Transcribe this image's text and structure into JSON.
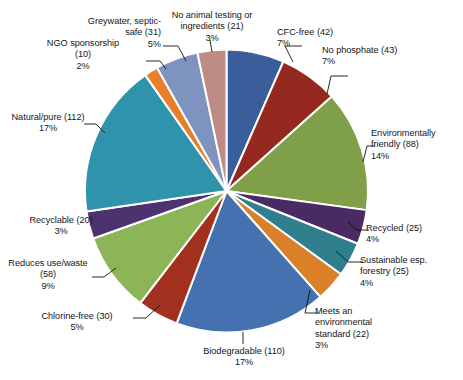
{
  "chart_data": {
    "type": "pie",
    "title": "",
    "subtitle": "",
    "xlabel": "",
    "ylabel": "",
    "legend_position": "none",
    "grid": false,
    "labels_show_counts": true,
    "labels_show_percent": true,
    "total": 637,
    "start_angle_deg": 0,
    "direction": "clockwise",
    "categories": [
      "CFC-free",
      "No phosphate",
      "Environmentally friendly",
      "Recycled",
      "Sustainable esp. forestry",
      "Meets an environmental standard",
      "Biodegradable",
      "Chlorine-free",
      "Reduces use/waste",
      "Recyclable",
      "Natural/pure",
      "NGO sponsorship",
      "Greywater, septic-safe",
      "No animal testing or ingredients"
    ],
    "values": [
      42,
      43,
      88,
      25,
      25,
      22,
      110,
      30,
      58,
      20,
      112,
      10,
      31,
      21
    ],
    "percents": [
      7,
      7,
      14,
      4,
      4,
      3,
      17,
      5,
      9,
      3,
      17,
      2,
      5,
      3
    ],
    "colors": [
      "#3a5e9b",
      "#96291f",
      "#7f9f49",
      "#4a2a63",
      "#2f7f8e",
      "#d98028",
      "#4671b0",
      "#a2301f",
      "#8bb557",
      "#4d3270",
      "#2f94ab",
      "#e8802b",
      "#7e93bd",
      "#bf8b85"
    ],
    "slices": [
      {
        "label": "CFC-free",
        "value": 42,
        "percent": 7,
        "color": "#3a5e9b"
      },
      {
        "label": "No phosphate",
        "value": 43,
        "percent": 7,
        "color": "#96291f"
      },
      {
        "label": "Environmentally friendly",
        "value": 88,
        "percent": 14,
        "color": "#7f9f49"
      },
      {
        "label": "Recycled",
        "value": 25,
        "percent": 4,
        "color": "#4a2a63"
      },
      {
        "label": "Sustainable esp. forestry",
        "value": 25,
        "percent": 4,
        "color": "#2f7f8e"
      },
      {
        "label": "Meets an environmental standard",
        "value": 22,
        "percent": 3,
        "color": "#d98028"
      },
      {
        "label": "Biodegradable",
        "value": 110,
        "percent": 17,
        "color": "#4671b0"
      },
      {
        "label": "Chlorine-free",
        "value": 30,
        "percent": 5,
        "color": "#a2301f"
      },
      {
        "label": "Reduces use/waste",
        "value": 58,
        "percent": 9,
        "color": "#8bb557"
      },
      {
        "label": "Recyclable",
        "value": 20,
        "percent": 3,
        "color": "#4d3270"
      },
      {
        "label": "Natural/pure",
        "value": 112,
        "percent": 17,
        "color": "#2f94ab"
      },
      {
        "label": "NGO sponsorship",
        "value": 10,
        "percent": 2,
        "color": "#e8802b"
      },
      {
        "label": "Greywater, septic-safe",
        "value": 31,
        "percent": 5,
        "color": "#7e93bd"
      },
      {
        "label": "No animal testing or ingredients",
        "value": 21,
        "percent": 3,
        "color": "#bf8b85"
      }
    ]
  },
  "callouts": {
    "cfc_free": "CFC-free (42)\n7%",
    "no_phosphate": "No phosphate (43)\n7%",
    "environmentally_friendly": "Environmentally\nfriendly (88)\n14%",
    "recycled": "Recycled (25)\n4%",
    "sustainable_forestry": "Sustainable esp.\nforestry (25)\n4%",
    "meets_standard": "Meets an\nenvironmental\nstandard (22)\n3%",
    "biodegradable": "Biodegradable (110)\n17%",
    "chlorine_free": "Chlorine-free (30)\n5%",
    "reduces_use_waste": "Reduces use/waste\n(58)\n9%",
    "recyclable": "Recyclable (20)\n3%",
    "natural_pure": "Natural/pure (112)\n17%",
    "ngo_sponsorship": "NGO sponsorship\n(10)\n2%",
    "greywater_septic_safe": "Greywater, septic-\nsafe (31)\n5%",
    "no_animal_testing": "No animal testing or\ningredients (21)\n3%"
  },
  "style": {
    "slice_separator_color": "#ffffff",
    "background": "#ffffff",
    "leader_line_color": "#111111",
    "text_color": "#161616"
  }
}
